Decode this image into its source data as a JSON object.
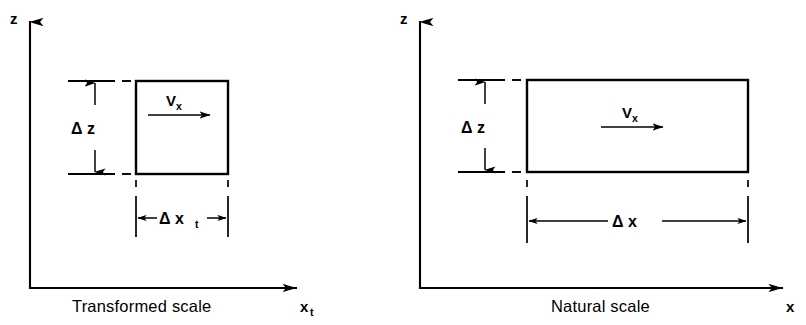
{
  "figure": {
    "background_color": "#ffffff",
    "line_color": "#000000"
  },
  "panels": [
    {
      "id": "transformed",
      "caption": "Transformed scale",
      "vertical_axis_label": "z",
      "horizontal_axis_label": "x",
      "horizontal_axis_subscript": "t",
      "velocity_label": "V",
      "velocity_subscript": "x",
      "height_dimension_label": "Δ z",
      "width_dimension_label": "Δ x",
      "width_dimension_subscript": "t",
      "box_shape": "square"
    },
    {
      "id": "natural",
      "caption": "Natural scale",
      "vertical_axis_label": "z",
      "horizontal_axis_label": "x",
      "horizontal_axis_subscript": "",
      "velocity_label": "V",
      "velocity_subscript": "x",
      "height_dimension_label": "Δ z",
      "width_dimension_label": "Δ x",
      "width_dimension_subscript": "",
      "box_shape": "rectangle-wide"
    }
  ]
}
